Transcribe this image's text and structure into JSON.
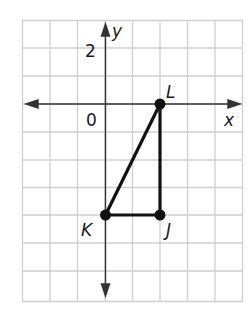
{
  "figure": {
    "type": "coordinate-plane",
    "axes": {
      "x_label": "x",
      "y_label": "y",
      "origin_label": "0",
      "y_tick_label": "2"
    },
    "grid": {
      "x_min": -3,
      "x_max": 5,
      "y_min": 3,
      "y_max": -7,
      "cell_units": 1
    },
    "points": [
      {
        "name": "L",
        "x": 2,
        "y": 0
      },
      {
        "name": "J",
        "x": 2,
        "y": -4
      },
      {
        "name": "K",
        "x": 0,
        "y": -4
      }
    ],
    "segments": [
      [
        "K",
        "L"
      ],
      [
        "L",
        "J"
      ],
      [
        "J",
        "K"
      ]
    ],
    "colors": {
      "grid": "#cfcfcf",
      "axis": "#333333",
      "shape": "#111111"
    }
  }
}
